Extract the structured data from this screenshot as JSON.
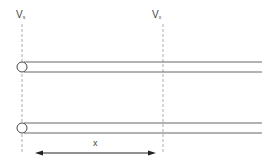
{
  "diagram": {
    "labels": {
      "left_voltage": {
        "main": "V",
        "sub": "s"
      },
      "right_voltage": {
        "main": "V",
        "sub": "x"
      },
      "distance": "x"
    },
    "conductors": [
      {
        "name": "upper-conductor"
      },
      {
        "name": "lower-conductor"
      }
    ],
    "colors": {
      "line": "#555555",
      "dashed": "#9a9a9a",
      "text": "#444444"
    }
  }
}
